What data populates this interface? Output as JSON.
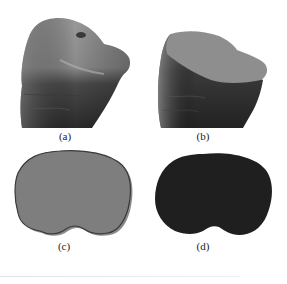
{
  "figure": {
    "panels": [
      {
        "id": "a",
        "label": "(a)",
        "description": "3D bone surface model, textured"
      },
      {
        "id": "b",
        "label": "(b)",
        "description": "3D bone model with flat cut cross-section plane"
      },
      {
        "id": "c",
        "label": "(c)",
        "description": "Cross-section contour outline comparison (gray fill, dark outline)"
      },
      {
        "id": "d",
        "label": "(d)",
        "description": "Cross-section filled region (dark)"
      }
    ],
    "colors": {
      "bone_light": "#8c8c8c",
      "bone_dark": "#2e2e2e",
      "plane_fill": "#8e8e8e",
      "contour_fill": "#7d7d7d",
      "contour_edge": "#3a3a3a",
      "region_fill": "#1f1f1f"
    }
  }
}
